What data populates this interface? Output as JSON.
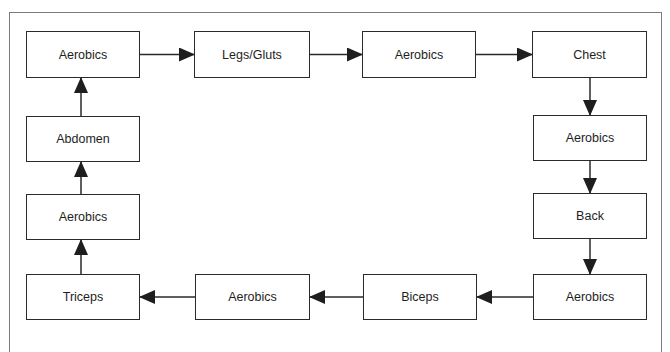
{
  "diagram": {
    "type": "circular workout flow",
    "nodes": [
      {
        "id": "n1",
        "label": "Aerobics"
      },
      {
        "id": "n2",
        "label": "Legs/Gluts"
      },
      {
        "id": "n3",
        "label": "Aerobics"
      },
      {
        "id": "n4",
        "label": "Chest"
      },
      {
        "id": "n5",
        "label": "Aerobics"
      },
      {
        "id": "n6",
        "label": "Back"
      },
      {
        "id": "n7",
        "label": "Aerobics"
      },
      {
        "id": "n8",
        "label": "Biceps"
      },
      {
        "id": "n9",
        "label": "Aerobics"
      },
      {
        "id": "n10",
        "label": "Triceps"
      },
      {
        "id": "n11",
        "label": "Aerobics"
      },
      {
        "id": "n12",
        "label": "Abdomen"
      }
    ],
    "edges": [
      [
        "n1",
        "n2"
      ],
      [
        "n2",
        "n3"
      ],
      [
        "n3",
        "n4"
      ],
      [
        "n4",
        "n5"
      ],
      [
        "n5",
        "n6"
      ],
      [
        "n6",
        "n7"
      ],
      [
        "n7",
        "n8"
      ],
      [
        "n8",
        "n9"
      ],
      [
        "n9",
        "n10"
      ],
      [
        "n10",
        "n11"
      ],
      [
        "n11",
        "n12"
      ],
      [
        "n12",
        "n1"
      ]
    ]
  }
}
